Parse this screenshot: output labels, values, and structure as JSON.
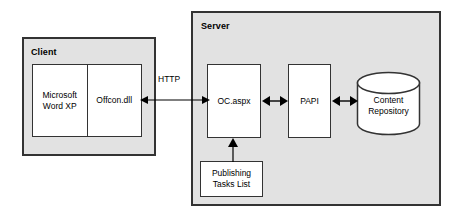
{
  "diagram": {
    "background_color": "#ffffff",
    "container_fill": "#e2e2e2",
    "node_fill": "#ffffff",
    "stroke_color": "#333333",
    "containers": [
      {
        "id": "client",
        "label": "Client"
      },
      {
        "id": "server",
        "label": "Server"
      }
    ],
    "nodes": [
      {
        "id": "word",
        "label": "Microsoft\nWord XP"
      },
      {
        "id": "offcon",
        "label": "Offcon.dll"
      },
      {
        "id": "ocaspx",
        "label": "OC.aspx"
      },
      {
        "id": "papi",
        "label": "PAPI"
      },
      {
        "id": "content_repository",
        "label": "Content\nRepository",
        "shape": "cylinder"
      },
      {
        "id": "publishing_tasks",
        "label": "Publishing\nTasks List"
      }
    ],
    "edges": [
      {
        "id": "http",
        "from": "offcon",
        "to": "ocaspx",
        "label": "HTTP",
        "direction": "bidirectional"
      },
      {
        "id": "oc-papi",
        "from": "ocaspx",
        "to": "papi",
        "label": "",
        "direction": "bidirectional"
      },
      {
        "id": "papi-repo",
        "from": "papi",
        "to": "content_repository",
        "label": "",
        "direction": "bidirectional"
      },
      {
        "id": "tasks-oc",
        "from": "publishing_tasks",
        "to": "ocaspx",
        "label": "",
        "direction": "up"
      }
    ]
  }
}
